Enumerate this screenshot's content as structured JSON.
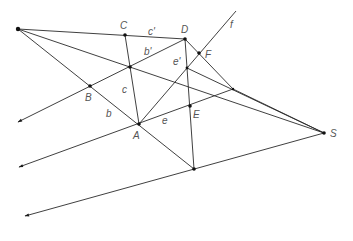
{
  "diagram": {
    "type": "projective-geometry-construction",
    "labels": {
      "A": "A",
      "B": "B",
      "C": "C",
      "D": "D",
      "E": "E",
      "F": "F",
      "S": "S",
      "b": "b",
      "c": "c",
      "e": "e",
      "b_prime": "b'",
      "c_prime": "c'",
      "e_prime": "e'",
      "f": "f"
    },
    "colors": {
      "line": "#2a2a2a",
      "point": "#111111",
      "label": "#555555"
    }
  }
}
